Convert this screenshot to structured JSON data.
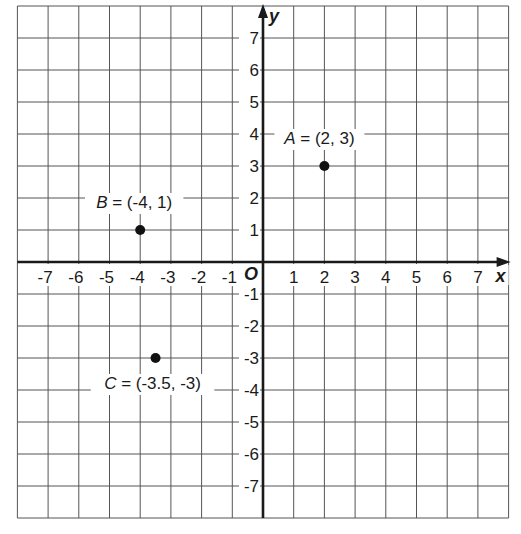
{
  "chart_data": {
    "type": "scatter",
    "title": "",
    "xlabel": "x",
    "ylabel": "y",
    "origin_label": "O",
    "xlim": [
      -8,
      8
    ],
    "ylim": [
      -8,
      8
    ],
    "grid": true,
    "x_ticks": [
      -7,
      -6,
      -5,
      -4,
      -3,
      -2,
      -1,
      1,
      2,
      3,
      4,
      5,
      6,
      7
    ],
    "y_ticks": [
      7,
      6,
      5,
      4,
      3,
      2,
      1,
      -1,
      -2,
      -3,
      -4,
      -5,
      -6,
      -7
    ],
    "points": [
      {
        "name": "A",
        "x": 2,
        "y": 3,
        "label": "A = (2, 3)"
      },
      {
        "name": "B",
        "x": -4,
        "y": 1,
        "label": "B = (-4, 1)"
      },
      {
        "name": "C",
        "x": -3.5,
        "y": -3,
        "label": "C = (-3.5, -3)"
      }
    ]
  },
  "colors": {
    "grid": "#555555",
    "axis": "#1a1a1a",
    "point": "#111111",
    "background": "#ffffff"
  }
}
